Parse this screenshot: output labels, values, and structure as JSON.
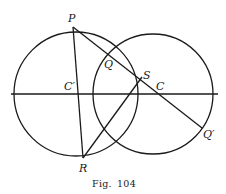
{
  "figure": {
    "caption_prefix": "Fig.",
    "caption_number": "104",
    "points": {
      "P": "P",
      "Q": "Q",
      "S": "S",
      "C": "C",
      "C_prime": "C′",
      "R": "R",
      "Q_prime": "Q′"
    },
    "elements": [
      "circle centered at C′",
      "circle centered at C",
      "horizontal line through C′ and C",
      "segment P–R",
      "segment P–Q′ through Q, S, C",
      "segment R–S extended"
    ]
  }
}
